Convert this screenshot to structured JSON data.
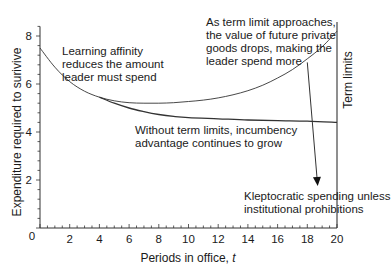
{
  "chart_data": {
    "type": "line",
    "title": "",
    "xlabel": "Periods in office, t",
    "xlabel_text": "Periods in office, ",
    "xlabel_var": "t",
    "ylabel": "Expenditure required to surivive",
    "xlim": [
      0,
      20
    ],
    "ylim": [
      0,
      8.4
    ],
    "grid": false,
    "x_ticks": [
      0,
      2,
      4,
      6,
      8,
      10,
      12,
      14,
      16,
      18,
      20
    ],
    "y_ticks": [
      2,
      4,
      6,
      8
    ],
    "origin_label": "0",
    "vertical_line": {
      "x": 20,
      "label": "Term limits"
    },
    "series": [
      {
        "name": "With term limits",
        "x": [
          0,
          1,
          2,
          3,
          4,
          5,
          6,
          7,
          8,
          9,
          10,
          11,
          12,
          13,
          14,
          15,
          16,
          17,
          18,
          19,
          20
        ],
        "values": [
          7.5,
          6.7,
          6.1,
          5.7,
          5.45,
          5.3,
          5.22,
          5.2,
          5.2,
          5.22,
          5.27,
          5.33,
          5.42,
          5.55,
          5.72,
          5.95,
          6.25,
          6.6,
          7.05,
          7.55,
          8.2
        ]
      },
      {
        "name": "Without term limits",
        "x": [
          4,
          5,
          6,
          7,
          8,
          9,
          10,
          12,
          14,
          16,
          18,
          20
        ],
        "values": [
          5.45,
          5.2,
          5.0,
          4.85,
          4.73,
          4.65,
          4.6,
          4.55,
          4.5,
          4.47,
          4.45,
          4.4
        ]
      }
    ],
    "arrow": {
      "from": [
        18,
        6.9
      ],
      "to": [
        18.7,
        1.75
      ]
    },
    "annotations": [
      {
        "id": "learning",
        "lines": [
          "Learning affinity",
          "reduces the amount",
          "leader must spend"
        ]
      },
      {
        "id": "term_approach",
        "lines": [
          "As term limit approaches,",
          "the value of future private",
          "goods drops, making the",
          "leader spend more"
        ]
      },
      {
        "id": "no_limits",
        "lines": [
          "Without term limits, incumbency",
          "advantage continues to grow"
        ]
      },
      {
        "id": "klepto",
        "lines": [
          "Kleptocratic spending unless",
          "institutional prohibitions"
        ]
      }
    ]
  },
  "labels": {
    "learning": "Learning affinity\nreduces the amount\nleader must spend",
    "term_approach": "As term limit approaches,\nthe value of future private\ngoods drops, making the\nleader spend more",
    "no_limits": "Without term limits, incumbency\nadvantage continues to grow",
    "klepto": "Kleptocratic spending unless\ninstitutional prohibitions"
  },
  "colors": {
    "ink": "#1a1a1a",
    "axis": "#333333",
    "curve": "#333333",
    "background": "#ffffff"
  }
}
